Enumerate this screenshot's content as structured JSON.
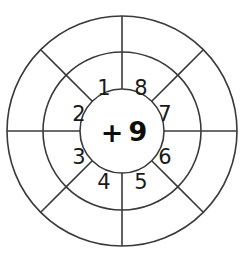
{
  "figure": {
    "center_operator": "+",
    "center_number": "9",
    "center_label": "+ 9"
  },
  "geometry": {
    "center_x": 122,
    "center_y": 131,
    "radius_inner": 42,
    "radius_middle": 79,
    "radius_outer": 115,
    "sector_count": 8
  },
  "colors": {
    "stroke": "#3a3a3a",
    "text": "#1a1a1a",
    "background": "#ffffff"
  },
  "sectors": [
    {
      "label": "1",
      "angle_deg": 292.5,
      "ring": "middle"
    },
    {
      "label": "8",
      "angle_deg": 247.5,
      "ring": "middle"
    },
    {
      "label": "7",
      "angle_deg": 202.5,
      "ring": "middle"
    },
    {
      "label": "6",
      "angle_deg": 157.5,
      "ring": "middle"
    },
    {
      "label": "5",
      "angle_deg": 112.5,
      "ring": "middle"
    },
    {
      "label": "4",
      "angle_deg": 67.5,
      "ring": "middle"
    },
    {
      "label": "3",
      "angle_deg": 22.5,
      "ring": "middle"
    },
    {
      "label": "2",
      "angle_deg": 337.5,
      "ring": "middle"
    }
  ],
  "sector_positions": {
    "1": {
      "x": 104,
      "y": 88
    },
    "8": {
      "x": 141,
      "y": 88
    },
    "7": {
      "x": 164,
      "y": 114
    },
    "6": {
      "x": 164,
      "y": 156
    },
    "5": {
      "x": 141,
      "y": 181
    },
    "4": {
      "x": 104,
      "y": 181
    },
    "3": {
      "x": 79,
      "y": 156
    },
    "2": {
      "x": 79,
      "y": 114
    }
  },
  "chart_data": {
    "type": "diagram",
    "diagram_kind": "concentric-number-wheel",
    "rings": [
      {
        "name": "inner",
        "content": "+ 9",
        "radius": 42
      },
      {
        "name": "middle",
        "content": [
          "1",
          "2",
          "3",
          "4",
          "5",
          "6",
          "7",
          "8"
        ],
        "radius": 79
      },
      {
        "name": "outer",
        "content": [
          "",
          "",
          "",
          "",
          "",
          "",
          "",
          ""
        ],
        "radius": 115
      }
    ],
    "spoke_angles_deg": [
      0,
      45,
      90,
      135,
      180,
      225,
      270,
      315
    ],
    "operation": "+",
    "operand": 9,
    "categories": [
      "1",
      "2",
      "3",
      "4",
      "5",
      "6",
      "7",
      "8"
    ],
    "values": [
      1,
      2,
      3,
      4,
      5,
      6,
      7,
      8
    ]
  }
}
